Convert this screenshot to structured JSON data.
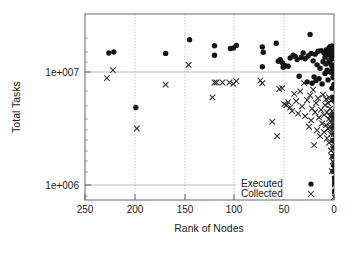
{
  "chart_data": {
    "type": "scatter",
    "title": "",
    "xlabel": "Rank of Nodes",
    "ylabel": "Total Tasks",
    "xlim": [
      250,
      0
    ],
    "x_reversed": true,
    "xticks": [
      250,
      200,
      150,
      100,
      50,
      0
    ],
    "xticklabels": [
      "250",
      "200",
      "150",
      "100",
      "50",
      "0"
    ],
    "yscale": "log",
    "ylim": [
      600000,
      30000000
    ],
    "yticks": [
      1000000,
      10000000
    ],
    "yticklabels": [
      "1e+006",
      "1e+007"
    ],
    "grid": true,
    "grid_axes": "both",
    "legend_position": "bottom-right",
    "legend": [
      "Executed",
      "Collected"
    ],
    "series": [
      {
        "name": "Executed",
        "marker": "filled-circle",
        "color": "#141414",
        "points": [
          [
            226,
            13200000
          ],
          [
            221,
            13500000
          ],
          [
            199,
            4200000
          ],
          [
            169,
            13100000
          ],
          [
            145,
            17500000
          ],
          [
            120,
            15400000
          ],
          [
            120,
            12600000
          ],
          [
            104,
            14500000
          ],
          [
            101,
            14700000
          ],
          [
            98,
            15500000
          ],
          [
            72,
            15000000
          ],
          [
            71,
            13400000
          ],
          [
            72,
            9900000
          ],
          [
            58,
            16200000
          ],
          [
            56,
            11100000
          ],
          [
            54,
            11500000
          ],
          [
            52,
            10800000
          ],
          [
            51,
            9800000
          ],
          [
            49,
            10100000
          ],
          [
            46,
            10000000
          ],
          [
            44,
            11900000
          ],
          [
            41,
            12600000
          ],
          [
            39,
            12300000
          ],
          [
            37,
            11500000
          ],
          [
            35,
            8100000
          ],
          [
            33,
            12000000
          ],
          [
            31,
            13200000
          ],
          [
            29,
            11700000
          ],
          [
            27,
            7200000
          ],
          [
            26,
            12400000
          ],
          [
            24,
            19500000
          ],
          [
            23,
            13100000
          ],
          [
            22,
            7000000
          ],
          [
            21,
            11200000
          ],
          [
            20,
            8000000
          ],
          [
            19,
            12900000
          ],
          [
            18,
            7400000
          ],
          [
            17,
            10300000
          ],
          [
            16,
            13700000
          ],
          [
            15,
            7700000
          ],
          [
            14,
            9600000
          ],
          [
            13,
            13900000
          ],
          [
            12,
            6900000
          ],
          [
            11,
            11000000
          ],
          [
            10,
            13300000
          ],
          [
            9,
            8600000
          ],
          [
            9,
            12100000
          ],
          [
            8,
            10500000
          ],
          [
            8,
            14100000
          ],
          [
            7,
            9200000
          ],
          [
            7,
            12800000
          ],
          [
            6,
            13600000
          ],
          [
            6,
            7500000
          ],
          [
            5,
            11300000
          ],
          [
            5,
            14600000
          ],
          [
            5,
            9000000
          ],
          [
            4,
            13000000
          ],
          [
            4,
            10700000
          ],
          [
            4,
            15100000
          ],
          [
            3,
            12200000
          ],
          [
            3,
            8800000
          ],
          [
            3,
            14900000
          ],
          [
            3,
            11600000
          ],
          [
            2,
            13400000
          ],
          [
            2,
            10000000
          ],
          [
            2,
            15300000
          ],
          [
            2,
            6300000
          ],
          [
            2,
            12500000
          ],
          [
            1,
            14200000
          ],
          [
            1,
            11800000
          ],
          [
            1,
            9400000
          ],
          [
            1,
            13800000
          ],
          [
            1,
            7900000
          ],
          [
            1,
            5200000
          ],
          [
            1,
            3600000
          ],
          [
            1,
            2800000
          ],
          [
            1,
            2100000
          ],
          [
            1,
            1500000
          ],
          [
            1,
            1100000
          ],
          [
            1,
            850000
          ],
          [
            0,
            13600000
          ],
          [
            0,
            12000000
          ],
          [
            0,
            10200000
          ],
          [
            0,
            8400000
          ],
          [
            0,
            6800000
          ],
          [
            0,
            4900000
          ],
          [
            0,
            3300000
          ],
          [
            0,
            2400000
          ],
          [
            0,
            1800000
          ],
          [
            0,
            1250000
          ],
          [
            0,
            950000
          ],
          [
            0,
            720000
          ]
        ]
      },
      {
        "name": "Collected",
        "marker": "cross-x",
        "color": "#2b2b2b",
        "points": [
          [
            228,
            7800000
          ],
          [
            222,
            9200000
          ],
          [
            198,
            2700000
          ],
          [
            169,
            6800000
          ],
          [
            146,
            10300000
          ],
          [
            122,
            5200000
          ],
          [
            120,
            7100000
          ],
          [
            118,
            7100000
          ],
          [
            112,
            7100000
          ],
          [
            105,
            7100000
          ],
          [
            101,
            6900000
          ],
          [
            98,
            7300000
          ],
          [
            74,
            7400000
          ],
          [
            72,
            7000000
          ],
          [
            62,
            3100000
          ],
          [
            57,
            2300000
          ],
          [
            55,
            6200000
          ],
          [
            52,
            6300000
          ],
          [
            50,
            4500000
          ],
          [
            48,
            4400000
          ],
          [
            46,
            4700000
          ],
          [
            44,
            4200000
          ],
          [
            42,
            3900000
          ],
          [
            40,
            5600000
          ],
          [
            38,
            4800000
          ],
          [
            36,
            3700000
          ],
          [
            34,
            5900000
          ],
          [
            32,
            4300000
          ],
          [
            30,
            7000000
          ],
          [
            29,
            3500000
          ],
          [
            27,
            4900000
          ],
          [
            25,
            2800000
          ],
          [
            24,
            5400000
          ],
          [
            23,
            3200000
          ],
          [
            22,
            4100000
          ],
          [
            21,
            6100000
          ],
          [
            20,
            1900000
          ],
          [
            19,
            3800000
          ],
          [
            18,
            4600000
          ],
          [
            17,
            2600000
          ],
          [
            16,
            5100000
          ],
          [
            15,
            3400000
          ],
          [
            14,
            2300000
          ],
          [
            13,
            4000000
          ],
          [
            12,
            3000000
          ],
          [
            11,
            5500000
          ],
          [
            10,
            2500000
          ],
          [
            10,
            3600000
          ],
          [
            9,
            4400000
          ],
          [
            8,
            2900000
          ],
          [
            8,
            5000000
          ],
          [
            7,
            2200000
          ],
          [
            7,
            3800000
          ],
          [
            6,
            4600000
          ],
          [
            6,
            2700000
          ],
          [
            5,
            3300000
          ],
          [
            5,
            5200000
          ],
          [
            5,
            2000000
          ],
          [
            4,
            4100000
          ],
          [
            4,
            2800000
          ],
          [
            4,
            3500000
          ],
          [
            3,
            4800000
          ],
          [
            3,
            2400000
          ],
          [
            3,
            3100000
          ],
          [
            3,
            1700000
          ],
          [
            2,
            3900000
          ],
          [
            2,
            2600000
          ],
          [
            2,
            1500000
          ],
          [
            2,
            3300000
          ],
          [
            2,
            1100000
          ],
          [
            1,
            2900000
          ],
          [
            1,
            2100000
          ],
          [
            1,
            1350000
          ],
          [
            1,
            900000
          ],
          [
            1,
            3600000
          ],
          [
            1,
            1750000
          ],
          [
            1,
            700000
          ],
          [
            0,
            2400000
          ],
          [
            0,
            1600000
          ],
          [
            0,
            1150000
          ],
          [
            0,
            820000
          ],
          [
            0,
            640000
          ],
          [
            0,
            3000000
          ],
          [
            0,
            2000000
          ],
          [
            0,
            1300000
          ]
        ]
      }
    ]
  },
  "axes": {
    "y_label": "Total Tasks",
    "x_label": "Rank of Nodes",
    "y_tick_1": "1e+006",
    "y_tick_2": "1e+007",
    "x_tick_250": "250",
    "x_tick_200": "200",
    "x_tick_150": "150",
    "x_tick_100": "100",
    "x_tick_50": "50",
    "x_tick_0": "0"
  },
  "legend": {
    "executed_label": "Executed",
    "collected_label": "Collected"
  }
}
